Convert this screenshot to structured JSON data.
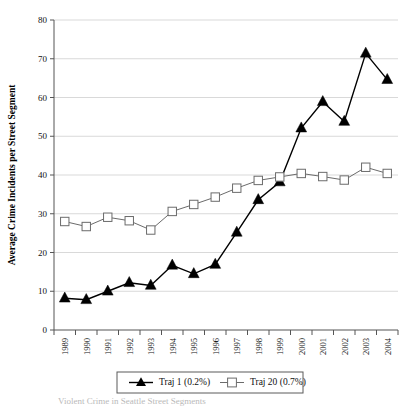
{
  "chart_data": {
    "type": "line",
    "title": "",
    "xlabel": "",
    "ylabel": "Average Crime Incidents per Street Segment",
    "ylim": [
      0,
      80
    ],
    "ytick_step": 10,
    "grid": true,
    "legend_position": "bottom",
    "categories": [
      "1989",
      "1990",
      "1991",
      "1992",
      "1993",
      "1994",
      "1995",
      "1996",
      "1997",
      "1998",
      "1999",
      "2000",
      "2001",
      "2002",
      "2003",
      "2004"
    ],
    "yticks": [
      "0",
      "10",
      "20",
      "30",
      "40",
      "50",
      "60",
      "70",
      "80"
    ],
    "series": [
      {
        "name": "Traj 1 (0.2%)",
        "marker": "filled-triangle",
        "color": "#000000",
        "values": [
          8.2,
          7.8,
          10.0,
          12.2,
          11.5,
          16.7,
          14.5,
          16.9,
          25.2,
          33.6,
          38.2,
          52.1,
          58.9,
          53.8,
          71.4,
          64.6
        ]
      },
      {
        "name": "Traj 20 (0.7%)",
        "marker": "open-square",
        "color": "#6b6b6b",
        "values": [
          28.0,
          26.7,
          29.1,
          28.2,
          25.8,
          30.6,
          32.4,
          34.3,
          36.6,
          38.6,
          39.5,
          40.4,
          39.6,
          38.7,
          42.0,
          40.4
        ]
      }
    ]
  },
  "legend": {
    "entries": [
      {
        "label": "Traj 1 (0.2%)",
        "marker": "filled-triangle"
      },
      {
        "label": "Traj 20 (0.7%)",
        "marker": "open-square"
      }
    ]
  },
  "caption": {
    "text": "Violent Crime in Seattle Street Segments"
  }
}
